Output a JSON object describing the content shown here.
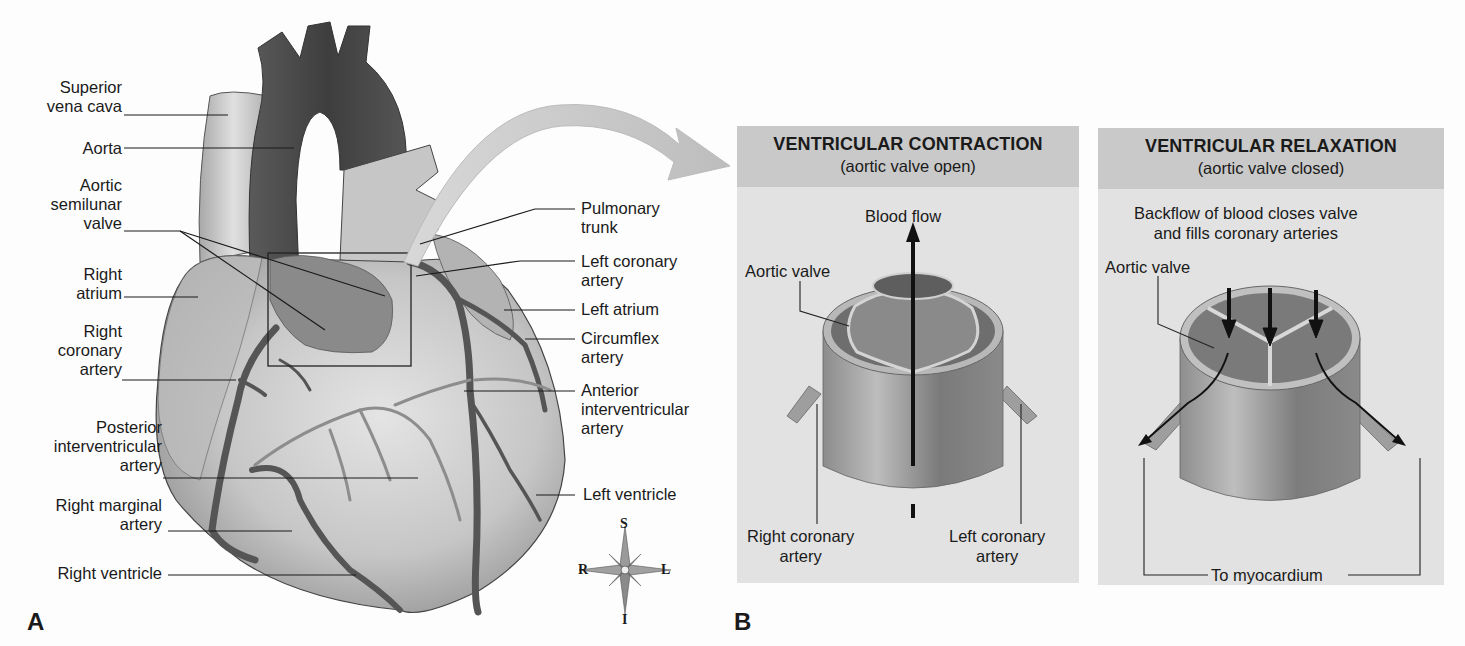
{
  "figure_a": {
    "letter": "A",
    "left_labels": [
      {
        "id": "superior-vena-cava",
        "lines": [
          "Superior",
          "vena cava"
        ]
      },
      {
        "id": "aorta",
        "lines": [
          "Aorta"
        ]
      },
      {
        "id": "aortic-semilunar-valve",
        "lines": [
          "Aortic",
          "semilunar",
          "valve"
        ]
      },
      {
        "id": "right-atrium",
        "lines": [
          "Right",
          "atrium"
        ]
      },
      {
        "id": "right-coronary-artery",
        "lines": [
          "Right",
          "coronary",
          "artery"
        ]
      },
      {
        "id": "posterior-interventricular-artery",
        "lines": [
          "Posterior",
          "interventricular",
          "artery"
        ]
      },
      {
        "id": "right-marginal-artery",
        "lines": [
          "Right marginal",
          "artery"
        ]
      },
      {
        "id": "right-ventricle",
        "lines": [
          "Right ventricle"
        ]
      }
    ],
    "right_labels": [
      {
        "id": "pulmonary-trunk",
        "lines": [
          "Pulmonary",
          "trunk"
        ]
      },
      {
        "id": "left-coronary-artery",
        "lines": [
          "Left coronary",
          "artery"
        ]
      },
      {
        "id": "left-atrium",
        "lines": [
          "Left atrium"
        ]
      },
      {
        "id": "circumflex-artery",
        "lines": [
          "Circumflex",
          "artery"
        ]
      },
      {
        "id": "anterior-interventricular-artery",
        "lines": [
          "Anterior",
          "interventricular",
          "artery"
        ]
      },
      {
        "id": "left-ventricle",
        "lines": [
          "Left ventricle"
        ]
      }
    ],
    "compass": {
      "top": "S",
      "bottom": "I",
      "left": "R",
      "right": "L"
    }
  },
  "figure_b": {
    "letter": "B",
    "contraction": {
      "title": "VENTRICULAR CONTRACTION",
      "subtitle": "(aortic valve open)",
      "flow_label": "Blood flow",
      "valve_label": "Aortic valve",
      "right_coronary": [
        "Right coronary",
        "artery"
      ],
      "left_coronary": [
        "Left coronary",
        "artery"
      ]
    },
    "relaxation": {
      "title": "VENTRICULAR RELAXATION",
      "subtitle": "(aortic valve closed)",
      "description": [
        "Backflow of blood closes valve",
        "and fills coronary arteries"
      ],
      "valve_label": "Aortic valve",
      "myocardium_label": "To myocardium"
    }
  },
  "colors": {
    "panel_header": "#c9c9c9",
    "panel_body": "#e2e2e2",
    "aorta": "#4a4a4a",
    "heart_light": "#c8c8c8",
    "artery": "#555555"
  }
}
